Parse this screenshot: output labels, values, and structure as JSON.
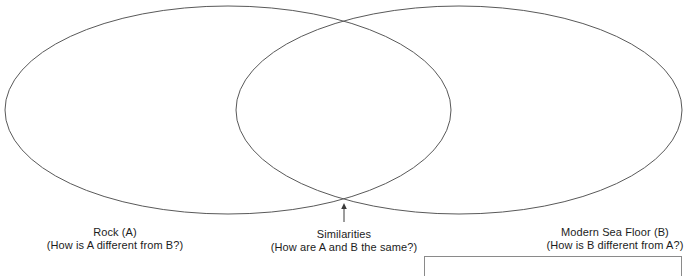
{
  "diagram": {
    "type": "venn",
    "title": "",
    "stroke_color": "#595959",
    "background_color": "#ffffff",
    "text_color": "#1c1c1c",
    "sets": [
      {
        "id": "a",
        "label": "Rock (A)",
        "question": "(How is A different from B?)",
        "center_x": 228,
        "center_y": 110,
        "radius_x": 223,
        "radius_y": 104
      },
      {
        "id": "b",
        "label": "Modern Sea Floor (B)",
        "question": "(How is B different from A?)",
        "center_x": 459,
        "center_y": 110,
        "radius_x": 223,
        "radius_y": 104
      }
    ],
    "intersection": {
      "label": "Similarities",
      "question": "(How are A and B the same?)",
      "pointer": {
        "from_x": 344,
        "from_y": 222,
        "to_x": 344,
        "to_y": 204
      }
    }
  },
  "bottom_panel": {
    "visible": true,
    "left": 424,
    "top": 256,
    "width": 258
  }
}
